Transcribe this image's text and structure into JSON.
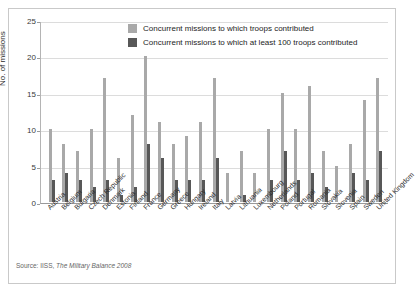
{
  "chart_data": {
    "type": "bar",
    "title": "",
    "subtitle": "",
    "xlabel": "",
    "ylabel": "No. of missions",
    "ylim": [
      0,
      25
    ],
    "yticks": [
      0,
      5,
      10,
      15,
      20,
      25
    ],
    "grid": true,
    "legend_position": "top-center",
    "categories": [
      "Austria",
      "Belgium",
      "Bulgaria",
      "Czech Republic",
      "Denmark",
      "Estonia",
      "Finland",
      "France",
      "Germany",
      "Greece",
      "Hungary",
      "Ireland",
      "Italy",
      "Latvia",
      "Lithuania",
      "Luxembourg",
      "Netherlands",
      "Poland",
      "Portugal",
      "Romania",
      "Slovakia",
      "Slovenia",
      "Spain",
      "Sweden",
      "United Kingdom"
    ],
    "series": [
      {
        "name": "Concurrent missions to which troops contributed",
        "color": "#a9a9a9",
        "values": [
          10,
          8,
          7,
          10,
          17,
          6,
          12,
          20,
          11,
          8,
          9,
          11,
          17,
          4,
          7,
          4,
          10,
          15,
          10,
          16,
          7,
          5,
          8,
          14,
          17
        ]
      },
      {
        "name": "Concurrent missions to which at least 100 troops contributed",
        "color": "#585858",
        "values": [
          3,
          4,
          3,
          2,
          3,
          1,
          2,
          8,
          6,
          3,
          3,
          3,
          6,
          0,
          1,
          0,
          3,
          7,
          3,
          4,
          2,
          0,
          4,
          3,
          7
        ]
      }
    ],
    "annotations": []
  },
  "legend": {
    "items": [
      {
        "label": "Concurrent missions to which troops contributed",
        "swatch": "light"
      },
      {
        "label": "Concurrent missions to which at least 100 troops contributed",
        "swatch": "dark"
      }
    ]
  },
  "source": {
    "prefix": "Source: IISS, ",
    "italic": "The Military Balance 2008"
  }
}
